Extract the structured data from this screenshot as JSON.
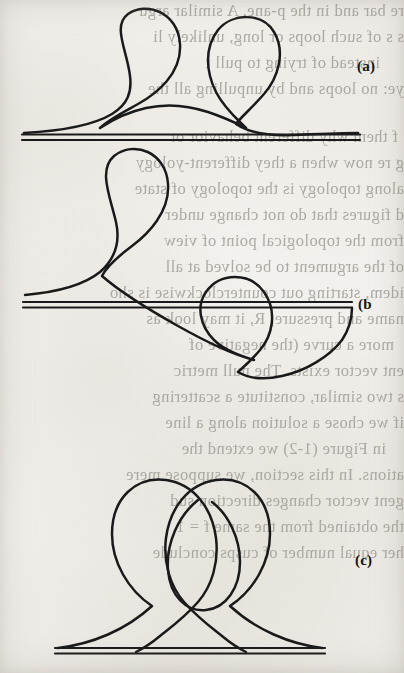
{
  "figure": {
    "kind": "scanned-book-figure",
    "background_color": "#f5f3f0",
    "ink_color": "#1a1a1a",
    "showthrough_color": "#9c9a94",
    "width": 404,
    "height": 673
  },
  "panels": [
    {
      "id": "a",
      "label": "(a)",
      "label_clipped": false,
      "baseline_y": 136,
      "baseline_x_start": 22,
      "baseline_x_end": 360,
      "baseline_style": "double-rule",
      "loops_above": 2,
      "loops_below": 0,
      "crossings": 2,
      "note": "Two teardrop loops rising from a curve that approaches the baseline asymptotically at both ends"
    },
    {
      "id": "b",
      "label": "(b",
      "label_clipped": true,
      "baseline_y": 303,
      "baseline_x_start": 23,
      "baseline_x_end": 352,
      "baseline_style": "double-rule",
      "loops_above": 1,
      "loops_below": 1,
      "crossings": 2,
      "note": "One loop above the line and one loop below; the curve crosses the baseline diagonally"
    },
    {
      "id": "c",
      "label": "(c)",
      "label_clipped": false,
      "baseline_y": 650,
      "baseline_x_start": 55,
      "baseline_x_end": 325,
      "baseline_style": "double-rule",
      "loops_above": 3,
      "loops_below": 0,
      "crossings": 3,
      "note": "Heart-shaped pair of large lobes crossing near the baseline, enclosing a small inner egg-shaped loop"
    }
  ],
  "showthrough_text": {
    "orientation": "mirrored",
    "origin": "reverse side of the page",
    "lines": [
      {
        "top": 2,
        "indent": 0,
        "text": "re bar and in the p-ane. A similar argu"
      },
      {
        "top": 28,
        "indent": 0,
        "text": "s   s of such loops or long, unlikely li"
      },
      {
        "top": 54,
        "indent": 24,
        "text": "instead of trying to pull t"
      },
      {
        "top": 80,
        "indent": 0,
        "text": "ye: no loops and by unpulling all the"
      },
      {
        "top": 128,
        "indent": 6,
        "text": "f them why different behavior or"
      },
      {
        "top": 154,
        "indent": 0,
        "text": "g re now when a they different-yology"
      },
      {
        "top": 180,
        "indent": 0,
        "text": "along topology is the topology of state"
      },
      {
        "top": 206,
        "indent": 0,
        "text": "d figures that do not change under"
      },
      {
        "top": 232,
        "indent": 0,
        "text": "from the topological point of view"
      },
      {
        "top": 258,
        "indent": 0,
        "text": "of the argument to be solved at all"
      },
      {
        "top": 284,
        "indent": 0,
        "text": "idem, starting out counterclockwise is sho"
      },
      {
        "top": 310,
        "indent": 0,
        "text": "name and pressure, R, it may look as"
      },
      {
        "top": 336,
        "indent": 10,
        "text": "more a curve (the negative of"
      },
      {
        "top": 362,
        "indent": 0,
        "text": "ent vector exists.  The null metric"
      },
      {
        "top": 388,
        "indent": 0,
        "text": "s two similar, constitute a scattering"
      },
      {
        "top": 414,
        "indent": 0,
        "text": "if we chose a solution along a line"
      },
      {
        "top": 440,
        "indent": 18,
        "text": "in Figure (1-2) we extend the"
      },
      {
        "top": 466,
        "indent": 0,
        "text": "ations. In this section, we suppose mere"
      },
      {
        "top": 492,
        "indent": 0,
        "text": "gent vector changes direction sud"
      },
      {
        "top": 518,
        "indent": 0,
        "text": "the obtained from the same  f = 1"
      },
      {
        "top": 544,
        "indent": 0,
        "text": "her equal number of cusps conclude"
      }
    ]
  }
}
